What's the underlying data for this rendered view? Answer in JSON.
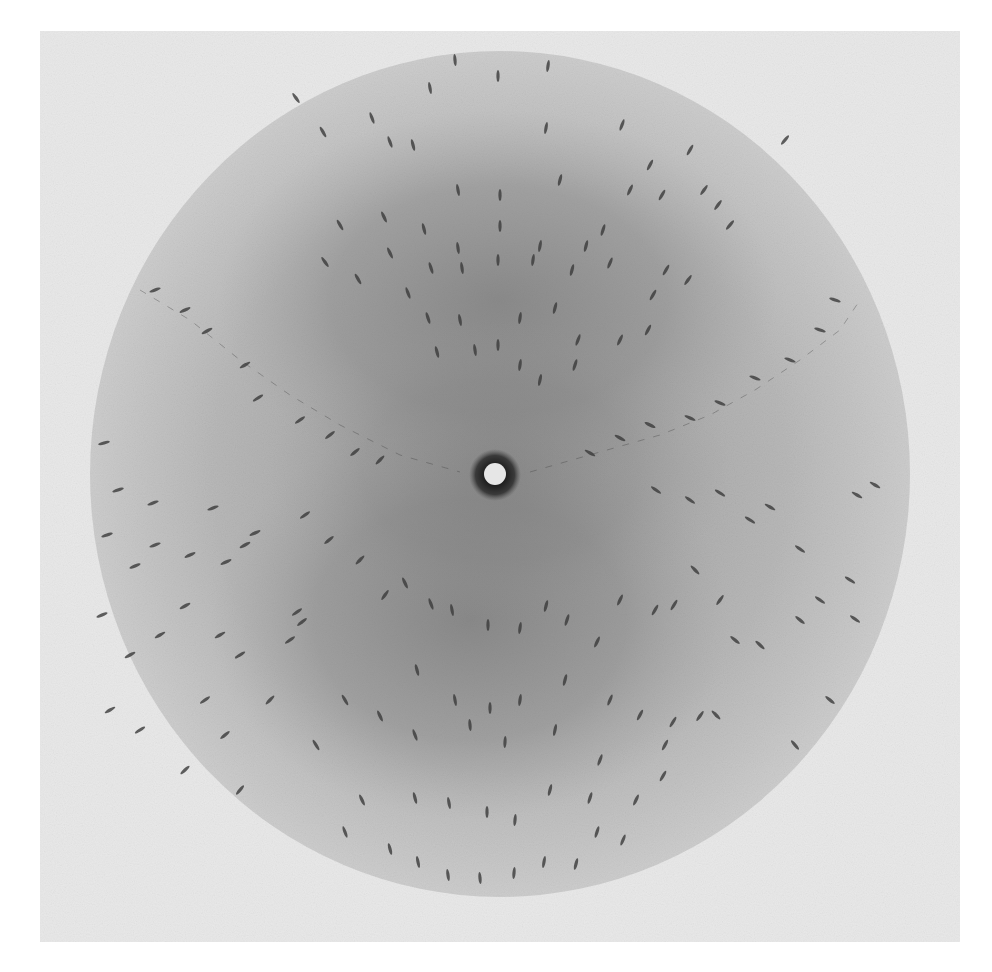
{
  "image": {
    "kind": "x-ray oscillation diffraction photograph",
    "width": 992,
    "height": 972
  },
  "colors": {
    "page_background": "#ffffff",
    "film_frame": "#e9e9e9",
    "disc_outer": "#c9c9c9",
    "halo_dark": "#7c7c7c",
    "beamstop_ring": "#2a2a2a",
    "beamstop_center": "#e6e6e6",
    "spot": "#3a3a3a"
  },
  "frame": {
    "x": 40,
    "y": 31,
    "w": 920,
    "h": 911
  },
  "disc": {
    "cx": 500,
    "cy": 474,
    "rx": 410,
    "ry": 423
  },
  "halo": [
    {
      "cx": 498,
      "cy": 300,
      "rx": 280,
      "ry": 190,
      "opacity": 0.55
    },
    {
      "cx": 470,
      "cy": 620,
      "rx": 260,
      "ry": 200,
      "opacity": 0.55
    },
    {
      "cx": 500,
      "cy": 470,
      "rx": 230,
      "ry": 150,
      "opacity": 0.35
    }
  ],
  "beamstop": {
    "cx": 495,
    "cy": 475,
    "ring_r": 26,
    "center_r": 11,
    "center_cy": 474
  },
  "lunes": [
    {
      "name": "left-lune",
      "points": [
        [
          140,
          290
        ],
        [
          190,
          320
        ],
        [
          240,
          360
        ],
        [
          290,
          395
        ],
        [
          340,
          425
        ],
        [
          400,
          455
        ],
        [
          460,
          472
        ]
      ]
    },
    {
      "name": "right-lune",
      "points": [
        [
          530,
          472
        ],
        [
          600,
          452
        ],
        [
          660,
          435
        ],
        [
          710,
          415
        ],
        [
          755,
          390
        ],
        [
          800,
          360
        ],
        [
          840,
          330
        ],
        [
          860,
          300
        ]
      ]
    }
  ],
  "spots": [
    [
      372,
      118,
      -20
    ],
    [
      430,
      88,
      -10
    ],
    [
      455,
      60,
      -5
    ],
    [
      498,
      76,
      0
    ],
    [
      548,
      66,
      8
    ],
    [
      622,
      125,
      20
    ],
    [
      690,
      150,
      30
    ],
    [
      296,
      98,
      -35
    ],
    [
      323,
      132,
      -30
    ],
    [
      390,
      142,
      -20
    ],
    [
      413,
      145,
      -15
    ],
    [
      458,
      190,
      -10
    ],
    [
      500,
      195,
      0
    ],
    [
      546,
      128,
      10
    ],
    [
      560,
      180,
      15
    ],
    [
      630,
      190,
      25
    ],
    [
      650,
      165,
      28
    ],
    [
      704,
      190,
      35
    ],
    [
      718,
      205,
      36
    ],
    [
      785,
      140,
      40
    ],
    [
      340,
      225,
      -30
    ],
    [
      384,
      217,
      -25
    ],
    [
      424,
      229,
      -15
    ],
    [
      458,
      248,
      -8
    ],
    [
      500,
      226,
      0
    ],
    [
      540,
      246,
      10
    ],
    [
      586,
      246,
      15
    ],
    [
      603,
      230,
      18
    ],
    [
      662,
      195,
      30
    ],
    [
      666,
      270,
      30
    ],
    [
      730,
      225,
      40
    ],
    [
      325,
      262,
      -35
    ],
    [
      358,
      279,
      -30
    ],
    [
      390,
      253,
      -25
    ],
    [
      431,
      268,
      -18
    ],
    [
      462,
      268,
      -8
    ],
    [
      498,
      260,
      0
    ],
    [
      533,
      260,
      8
    ],
    [
      572,
      270,
      15
    ],
    [
      610,
      263,
      22
    ],
    [
      653,
      295,
      30
    ],
    [
      688,
      280,
      35
    ],
    [
      408,
      293,
      -20
    ],
    [
      428,
      318,
      -18
    ],
    [
      460,
      320,
      -10
    ],
    [
      498,
      345,
      0
    ],
    [
      520,
      318,
      8
    ],
    [
      555,
      308,
      15
    ],
    [
      578,
      340,
      20
    ],
    [
      620,
      340,
      25
    ],
    [
      648,
      330,
      28
    ],
    [
      437,
      352,
      -15
    ],
    [
      475,
      350,
      -8
    ],
    [
      520,
      365,
      8
    ],
    [
      540,
      380,
      12
    ],
    [
      575,
      365,
      18
    ],
    [
      155,
      290,
      70
    ],
    [
      185,
      310,
      65
    ],
    [
      207,
      331,
      62
    ],
    [
      245,
      365,
      60
    ],
    [
      258,
      398,
      58
    ],
    [
      300,
      420,
      55
    ],
    [
      330,
      435,
      52
    ],
    [
      355,
      452,
      50
    ],
    [
      380,
      460,
      45
    ],
    [
      590,
      453,
      -60
    ],
    [
      620,
      438,
      -62
    ],
    [
      650,
      425,
      -64
    ],
    [
      690,
      418,
      -66
    ],
    [
      720,
      403,
      -68
    ],
    [
      755,
      378,
      -70
    ],
    [
      790,
      360,
      -70
    ],
    [
      820,
      330,
      -72
    ],
    [
      835,
      300,
      -72
    ],
    [
      104,
      443,
      75
    ],
    [
      118,
      490,
      72
    ],
    [
      153,
      503,
      70
    ],
    [
      107,
      535,
      72
    ],
    [
      155,
      545,
      70
    ],
    [
      135,
      566,
      68
    ],
    [
      190,
      555,
      65
    ],
    [
      226,
      562,
      65
    ],
    [
      185,
      606,
      62
    ],
    [
      160,
      635,
      60
    ],
    [
      220,
      635,
      60
    ],
    [
      240,
      655,
      58
    ],
    [
      297,
      612,
      55
    ],
    [
      290,
      640,
      55
    ],
    [
      270,
      700,
      45
    ],
    [
      302,
      622,
      52
    ],
    [
      213,
      508,
      70
    ],
    [
      255,
      533,
      65
    ],
    [
      245,
      545,
      62
    ],
    [
      305,
      515,
      55
    ],
    [
      329,
      540,
      50
    ],
    [
      360,
      560,
      45
    ],
    [
      385,
      595,
      35
    ],
    [
      405,
      583,
      -25
    ],
    [
      431,
      604,
      -20
    ],
    [
      452,
      610,
      -10
    ],
    [
      488,
      625,
      0
    ],
    [
      520,
      628,
      8
    ],
    [
      546,
      606,
      15
    ],
    [
      567,
      620,
      18
    ],
    [
      597,
      642,
      25
    ],
    [
      620,
      600,
      25
    ],
    [
      655,
      610,
      30
    ],
    [
      674,
      605,
      32
    ],
    [
      720,
      600,
      35
    ],
    [
      417,
      670,
      -15
    ],
    [
      455,
      700,
      -10
    ],
    [
      490,
      708,
      0
    ],
    [
      520,
      700,
      8
    ],
    [
      565,
      680,
      15
    ],
    [
      610,
      700,
      22
    ],
    [
      640,
      715,
      28
    ],
    [
      673,
      722,
      32
    ],
    [
      700,
      716,
      35
    ],
    [
      345,
      700,
      -30
    ],
    [
      380,
      716,
      -25
    ],
    [
      415,
      735,
      -20
    ],
    [
      470,
      725,
      -5
    ],
    [
      505,
      742,
      3
    ],
    [
      555,
      730,
      12
    ],
    [
      600,
      760,
      20
    ],
    [
      665,
      745,
      28
    ],
    [
      316,
      745,
      -32
    ],
    [
      362,
      800,
      -25
    ],
    [
      415,
      798,
      -15
    ],
    [
      449,
      803,
      -10
    ],
    [
      487,
      812,
      0
    ],
    [
      515,
      820,
      5
    ],
    [
      550,
      790,
      15
    ],
    [
      590,
      798,
      18
    ],
    [
      636,
      800,
      25
    ],
    [
      663,
      776,
      30
    ],
    [
      345,
      832,
      -20
    ],
    [
      390,
      849,
      -15
    ],
    [
      418,
      862,
      -12
    ],
    [
      448,
      875,
      -8
    ],
    [
      480,
      878,
      -5
    ],
    [
      514,
      873,
      5
    ],
    [
      544,
      862,
      10
    ],
    [
      576,
      864,
      15
    ],
    [
      597,
      832,
      18
    ],
    [
      623,
      840,
      22
    ],
    [
      656,
      490,
      -55
    ],
    [
      690,
      500,
      -55
    ],
    [
      720,
      493,
      -58
    ],
    [
      770,
      507,
      -60
    ],
    [
      800,
      549,
      -55
    ],
    [
      857,
      495,
      -60
    ],
    [
      875,
      485,
      -60
    ],
    [
      850,
      580,
      -58
    ],
    [
      855,
      619,
      -55
    ],
    [
      820,
      600,
      -55
    ],
    [
      750,
      520,
      -58
    ],
    [
      735,
      640,
      -50
    ],
    [
      695,
      570,
      -45
    ],
    [
      716,
      715,
      -45
    ],
    [
      760,
      645,
      -48
    ],
    [
      800,
      620,
      -50
    ],
    [
      830,
      700,
      -50
    ],
    [
      795,
      745,
      -40
    ],
    [
      102,
      615,
      68
    ],
    [
      130,
      655,
      62
    ],
    [
      110,
      710,
      60
    ],
    [
      140,
      730,
      58
    ],
    [
      205,
      700,
      55
    ],
    [
      225,
      735,
      50
    ],
    [
      185,
      770,
      48
    ],
    [
      240,
      790,
      40
    ]
  ]
}
